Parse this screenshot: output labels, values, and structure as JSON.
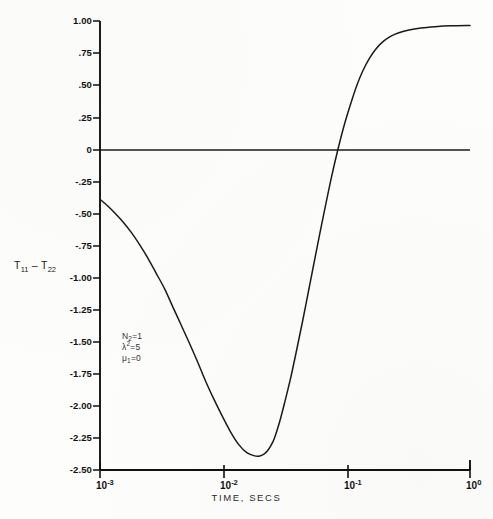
{
  "chart_data": {
    "type": "line",
    "title": "",
    "xlabel": "TIME, SECS",
    "ylabel": "T11 - T22",
    "xscale": "log",
    "xlim": [
      0.001,
      1
    ],
    "ylim": [
      -2.5,
      1.0
    ],
    "grid": false,
    "legend": "none",
    "x_tick_labels": [
      "10⁻³",
      "10⁻²",
      "10⁻¹",
      "10⁰"
    ],
    "x_tick_values": [
      0.001,
      0.01,
      0.1,
      1
    ],
    "x_tick_mantissa": "10",
    "x_tick_exponents": [
      "-3",
      "-2",
      "-1",
      "0"
    ],
    "y_tick_labels": [
      "1.00",
      ".75",
      ".50",
      ".25",
      "0",
      "-.25",
      "-.50",
      "-.75",
      "-1.00",
      "-1.25",
      "-1.50",
      "-1.75",
      "-2.00",
      "-2.25",
      "-2.50"
    ],
    "y_tick_values": [
      1.0,
      0.75,
      0.5,
      0.25,
      0,
      -0.25,
      -0.5,
      -0.75,
      -1.0,
      -1.25,
      -1.5,
      -1.75,
      -2.0,
      -2.25,
      -2.5
    ],
    "series": [
      {
        "name": "T11 - T22",
        "color": "#1a1a1a",
        "x": [
          0.001,
          0.00115,
          0.00133,
          0.00155,
          0.0018,
          0.0021,
          0.00245,
          0.00285,
          0.00335,
          0.0039,
          0.00455,
          0.0053,
          0.0062,
          0.0072,
          0.0084,
          0.0098,
          0.0114,
          0.0133,
          0.0155,
          0.018,
          0.0198,
          0.0215,
          0.0228,
          0.0243,
          0.026,
          0.0285,
          0.0315,
          0.035,
          0.039,
          0.0435,
          0.0485,
          0.054,
          0.0605,
          0.068,
          0.076,
          0.085,
          0.095,
          0.107,
          0.12,
          0.135,
          0.152,
          0.172,
          0.195,
          0.225,
          0.265,
          0.32,
          0.4,
          0.52,
          0.7,
          1.0
        ],
        "y": [
          -0.39,
          -0.44,
          -0.5,
          -0.57,
          -0.65,
          -0.745,
          -0.85,
          -0.965,
          -1.09,
          -1.23,
          -1.37,
          -1.51,
          -1.66,
          -1.81,
          -1.95,
          -2.08,
          -2.2,
          -2.3,
          -2.365,
          -2.39,
          -2.39,
          -2.375,
          -2.35,
          -2.31,
          -2.25,
          -2.13,
          -1.97,
          -1.79,
          -1.58,
          -1.36,
          -1.13,
          -0.9,
          -0.66,
          -0.42,
          -0.2,
          0.0,
          0.18,
          0.345,
          0.49,
          0.61,
          0.705,
          0.78,
          0.835,
          0.878,
          0.908,
          0.93,
          0.945,
          0.955,
          0.962,
          0.965
        ],
        "zero_crossing_x": 0.085,
        "minimum": {
          "x": 0.019,
          "y": -2.39
        },
        "start_value": -0.39,
        "plateau_value": 0.965
      },
      {
        "name": "zero-reference-line",
        "color": "#1a1a1a",
        "y_constant": 0
      }
    ],
    "annotations": [
      {
        "text": "N2=1",
        "symbol": "N",
        "subscript": "2",
        "value": "1"
      },
      {
        "text": "λ2=5",
        "symbol": "λ",
        "superscript": "2",
        "value": "5"
      },
      {
        "text": "μ1=0",
        "symbol": "μ",
        "subscript": "1",
        "value": "0"
      }
    ]
  },
  "axes": {
    "y_title_main": "T",
    "y_title_sub1": "11",
    "y_title_dash": " – T",
    "y_title_sub2": "22",
    "x_title": "TIME, SECS"
  },
  "annotation_lines": {
    "line1_symbol": "N",
    "line1_sub": "2",
    "line1_rest": "=1",
    "line2_symbol": "λ",
    "line2_sup": "2",
    "line2_rest": "=5",
    "line3_symbol": "μ",
    "line3_sub": "1",
    "line3_rest": "=0"
  },
  "colors": {
    "curve": "#1a1a1a",
    "axis": "#111111",
    "background": "#fdfdfc"
  }
}
